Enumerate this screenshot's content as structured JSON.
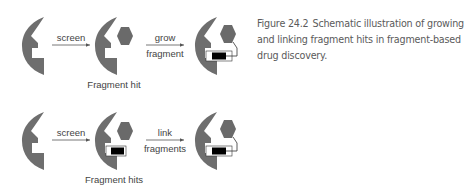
{
  "colors": {
    "receptor": "#6e6e6e",
    "fragment_hexagon": "#6a6a6a",
    "fragment_block": "#000000",
    "pocket_white": "#ffffff",
    "arrow": "#555555",
    "text": "#444444",
    "caption_text": "#5a5a5a"
  },
  "rows": [
    {
      "id": "growing",
      "steps": [
        {
          "shape": "empty-receptor"
        },
        {
          "arrow_label_top": "screen",
          "arrow_label_bottom": ""
        },
        {
          "shape": "receptor-with-hexagon",
          "sublabel": "Fragment hit"
        },
        {
          "arrow_label_top": "grow",
          "arrow_label_bottom": "fragment"
        },
        {
          "shape": "receptor-with-grown-fragment"
        }
      ]
    },
    {
      "id": "linking",
      "steps": [
        {
          "shape": "empty-receptor"
        },
        {
          "arrow_label_top": "screen",
          "arrow_label_bottom": ""
        },
        {
          "shape": "receptor-with-two-fragments",
          "sublabel": "Fragment hits"
        },
        {
          "arrow_label_top": "link",
          "arrow_label_bottom": "fragments"
        },
        {
          "shape": "receptor-with-linked-fragments"
        }
      ]
    }
  ],
  "caption": {
    "figure_number": "Figure 24.2",
    "text": "Schematic illustration of growing and linking fragment hits in fragment-based drug discovery."
  }
}
